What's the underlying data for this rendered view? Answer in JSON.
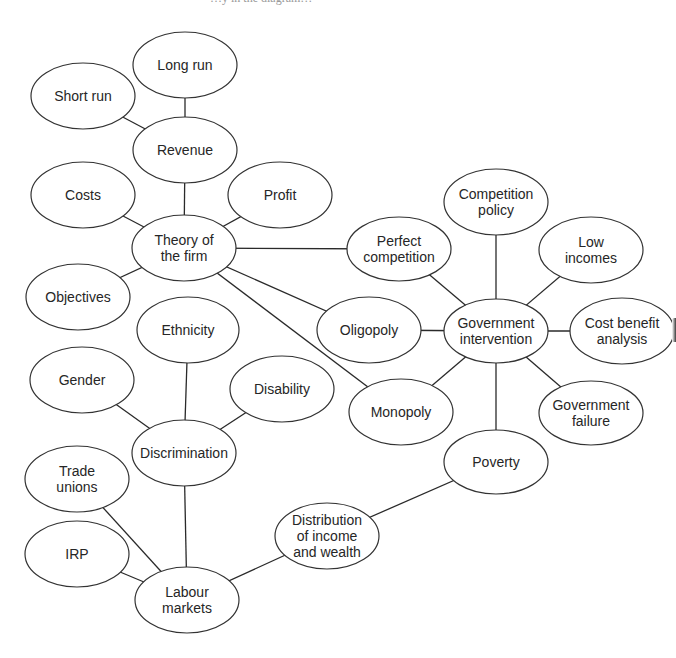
{
  "diagram": {
    "title_fragment": "…y in the diagram…",
    "colors": {
      "line": "#2a2a2a",
      "node_border": "#333333",
      "text": "#262626",
      "background": "#ffffff"
    },
    "nodes": [
      {
        "id": "long-run",
        "lines": [
          "Long run"
        ],
        "cx": 185,
        "cy": 65,
        "rx": 52,
        "ry": 33
      },
      {
        "id": "short-run",
        "lines": [
          "Short run"
        ],
        "cx": 83,
        "cy": 96,
        "rx": 52,
        "ry": 33
      },
      {
        "id": "revenue",
        "lines": [
          "Revenue"
        ],
        "cx": 185,
        "cy": 150,
        "rx": 52,
        "ry": 33
      },
      {
        "id": "costs",
        "lines": [
          "Costs"
        ],
        "cx": 83,
        "cy": 195,
        "rx": 52,
        "ry": 33
      },
      {
        "id": "profit",
        "lines": [
          "Profit"
        ],
        "cx": 280,
        "cy": 195,
        "rx": 52,
        "ry": 33
      },
      {
        "id": "theory-of-the-firm",
        "lines": [
          "Theory of",
          "the firm"
        ],
        "cx": 184,
        "cy": 248,
        "rx": 52,
        "ry": 33
      },
      {
        "id": "objectives",
        "lines": [
          "Objectives"
        ],
        "cx": 78,
        "cy": 297,
        "rx": 52,
        "ry": 33
      },
      {
        "id": "perfect-competition",
        "lines": [
          "Perfect",
          "competition"
        ],
        "cx": 399,
        "cy": 249,
        "rx": 52,
        "ry": 32
      },
      {
        "id": "competition-policy",
        "lines": [
          "Competition",
          "policy"
        ],
        "cx": 496,
        "cy": 202,
        "rx": 52,
        "ry": 33
      },
      {
        "id": "low-incomes",
        "lines": [
          "Low",
          "incomes"
        ],
        "cx": 591,
        "cy": 250,
        "rx": 52,
        "ry": 33
      },
      {
        "id": "ethnicity",
        "lines": [
          "Ethnicity"
        ],
        "cx": 188,
        "cy": 330,
        "rx": 51,
        "ry": 33
      },
      {
        "id": "oligopoly",
        "lines": [
          "Oligopoly"
        ],
        "cx": 369,
        "cy": 330,
        "rx": 52,
        "ry": 33
      },
      {
        "id": "government-intervention",
        "lines": [
          "Government",
          "intervention"
        ],
        "cx": 496,
        "cy": 331,
        "rx": 52,
        "ry": 32
      },
      {
        "id": "cost-benefit-analysis",
        "lines": [
          "Cost benefit",
          "analysis"
        ],
        "cx": 622,
        "cy": 331,
        "rx": 52,
        "ry": 33
      },
      {
        "id": "gender",
        "lines": [
          "Gender"
        ],
        "cx": 82,
        "cy": 380,
        "rx": 52,
        "ry": 33
      },
      {
        "id": "disability",
        "lines": [
          "Disability"
        ],
        "cx": 282,
        "cy": 389,
        "rx": 52,
        "ry": 33
      },
      {
        "id": "monopoly",
        "lines": [
          "Monopoly"
        ],
        "cx": 401,
        "cy": 412,
        "rx": 52,
        "ry": 33
      },
      {
        "id": "government-failure",
        "lines": [
          "Government",
          "failure"
        ],
        "cx": 591,
        "cy": 413,
        "rx": 52,
        "ry": 32
      },
      {
        "id": "discrimination",
        "lines": [
          "Discrimination"
        ],
        "cx": 184,
        "cy": 453,
        "rx": 52,
        "ry": 33
      },
      {
        "id": "poverty",
        "lines": [
          "Poverty"
        ],
        "cx": 496,
        "cy": 462,
        "rx": 52,
        "ry": 32
      },
      {
        "id": "trade-unions",
        "lines": [
          "Trade",
          "unions"
        ],
        "cx": 77,
        "cy": 479,
        "rx": 52,
        "ry": 33
      },
      {
        "id": "distribution-of-income-and-wealth",
        "lines": [
          "Distribution",
          "of income",
          "and wealth"
        ],
        "cx": 327,
        "cy": 536,
        "rx": 52,
        "ry": 33
      },
      {
        "id": "irp",
        "lines": [
          "IRP"
        ],
        "cx": 77,
        "cy": 554,
        "rx": 52,
        "ry": 33
      },
      {
        "id": "labour-markets",
        "lines": [
          "Labour",
          "markets"
        ],
        "cx": 187,
        "cy": 600,
        "rx": 52,
        "ry": 33
      }
    ],
    "edges": [
      [
        "long-run",
        "revenue"
      ],
      [
        "short-run",
        "revenue"
      ],
      [
        "revenue",
        "theory-of-the-firm"
      ],
      [
        "costs",
        "theory-of-the-firm"
      ],
      [
        "profit",
        "theory-of-the-firm"
      ],
      [
        "objectives",
        "theory-of-the-firm"
      ],
      [
        "theory-of-the-firm",
        "perfect-competition"
      ],
      [
        "theory-of-the-firm",
        "oligopoly"
      ],
      [
        "theory-of-the-firm",
        "monopoly"
      ],
      [
        "perfect-competition",
        "government-intervention"
      ],
      [
        "competition-policy",
        "government-intervention"
      ],
      [
        "low-incomes",
        "government-intervention"
      ],
      [
        "oligopoly",
        "government-intervention"
      ],
      [
        "cost-benefit-analysis",
        "government-intervention"
      ],
      [
        "monopoly",
        "government-intervention"
      ],
      [
        "government-failure",
        "government-intervention"
      ],
      [
        "poverty",
        "government-intervention"
      ],
      [
        "ethnicity",
        "discrimination"
      ],
      [
        "gender",
        "discrimination"
      ],
      [
        "disability",
        "discrimination"
      ],
      [
        "discrimination",
        "labour-markets"
      ],
      [
        "trade-unions",
        "labour-markets"
      ],
      [
        "irp",
        "labour-markets"
      ],
      [
        "labour-markets",
        "distribution-of-income-and-wealth"
      ],
      [
        "distribution-of-income-and-wealth",
        "poverty"
      ]
    ]
  }
}
